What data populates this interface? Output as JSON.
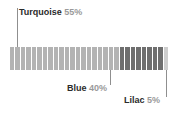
{
  "chart_data": {
    "type": "bar",
    "title": "",
    "subtitle": "",
    "xlabel": "",
    "ylabel": "",
    "orientation": "horizontal",
    "style": "segmented-stacked-bar",
    "grid": false,
    "legend_position": "callout-labels",
    "total_segments": 29,
    "categories": [
      "Turquoise",
      "Blue",
      "Lilac"
    ],
    "values": [
      55,
      40,
      5
    ],
    "unit": "%",
    "colors": [
      "#b3b3b3",
      "#6e6e6e",
      "#cdcdcd"
    ],
    "segment_counts": [
      20,
      8,
      1
    ],
    "annotations": [
      {
        "label": "Turquoise",
        "value": "55%",
        "position": "above-left"
      },
      {
        "label": "Blue",
        "value": "40%",
        "position": "below-center"
      },
      {
        "label": "Lilac",
        "value": "5%",
        "position": "below-right"
      }
    ]
  },
  "labels": {
    "turquoise": {
      "name": "Turquoise",
      "pct": "55%"
    },
    "blue": {
      "name": "Blue",
      "pct": "40%"
    },
    "lilac": {
      "name": "Lilac",
      "pct": "5%"
    }
  },
  "colors": {
    "turquoise": "#b3b3b3",
    "blue": "#6e6e6e",
    "lilac": "#cdcdcd",
    "leader_line": "#8f8f8f",
    "label_name": "#2b2b2b",
    "label_pct": "#9a9a9a",
    "background": "#ffffff"
  }
}
